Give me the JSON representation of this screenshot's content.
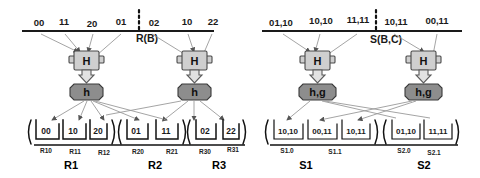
{
  "diagram": {
    "title_hidden": "",
    "relations": [
      {
        "name": "R(B)",
        "side": "left",
        "top_tuples": [
          "00",
          "11",
          "20",
          "01",
          "02",
          "10",
          "22"
        ],
        "hash_box_label": "H",
        "hash_fn_label": "h",
        "groups": [
          {
            "label": "R1",
            "cells": [
              "00",
              "10",
              "20"
            ],
            "sublabels": [
              "R10",
              "R11",
              "R12"
            ]
          },
          {
            "label": "R2",
            "cells": [
              "01",
              "11"
            ],
            "sublabels": [
              "R20",
              "R21"
            ]
          },
          {
            "label": "R3",
            "cells": [
              "02",
              "22"
            ],
            "sublabels": [
              "R30",
              "R31"
            ]
          }
        ]
      },
      {
        "name": "S(B,C)",
        "side": "right",
        "top_tuples": [
          "01,10",
          "10,10",
          "11,11",
          "10,11",
          "00,11"
        ],
        "hash_box_label": "H",
        "hash_fn_label": "h,g",
        "groups": [
          {
            "label": "S1",
            "cells": [
              "10,10",
              "00,11",
              "10,11"
            ],
            "sublabels": [
              "S1.0",
              "S1.1"
            ]
          },
          {
            "label": "S2",
            "cells": [
              "01,10",
              "11,11"
            ],
            "sublabels": [
              "S2.0",
              "S2.1"
            ]
          }
        ]
      }
    ],
    "colors": {
      "hash_box": "#cfcfcf",
      "hash_fn_box": "#8d8d8d",
      "edge": "#9a9a9a",
      "ink": "#1a1a1a",
      "background": "#ffffff"
    },
    "icons": {
      "divider": "vertical-dotted-divider",
      "down_arrow": "thick-down-arrow",
      "edge_arrow": "small-arrowhead"
    }
  }
}
